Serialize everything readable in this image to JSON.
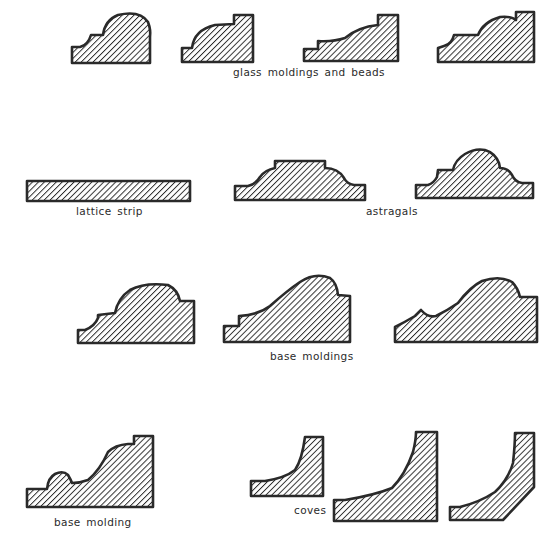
{
  "diagram": {
    "colors": {
      "stroke": "#2a2a2a",
      "hatch": "#2a2a2a",
      "background": "#ffffff",
      "text": "#2b2b2b"
    },
    "groups": [
      {
        "id": "glass",
        "label": "glass moldings and beads",
        "profile_count": 4
      },
      {
        "id": "lattice",
        "label": "lattice strip",
        "profile_count": 1
      },
      {
        "id": "astragals",
        "label": "astragals",
        "profile_count": 2
      },
      {
        "id": "base-moldings",
        "label": "base moldings",
        "profile_count": 3
      },
      {
        "id": "base-molding",
        "label": "base molding",
        "profile_count": 1
      },
      {
        "id": "coves",
        "label": "coves",
        "profile_count": 3
      }
    ]
  },
  "labels": {
    "glass": "glass moldings and beads",
    "lattice": "lattice strip",
    "astragals": "astragals",
    "base_moldings": "base moldings",
    "base_molding": "base molding",
    "coves": "coves"
  }
}
